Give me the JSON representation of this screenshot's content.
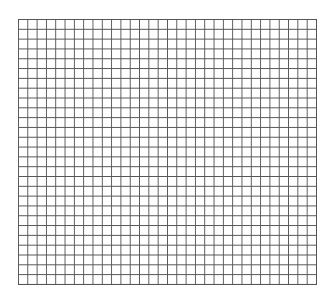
{
  "grid": {
    "columns": 32,
    "rows": 27,
    "line_color": "#555555",
    "background_color": "#ffffff"
  }
}
